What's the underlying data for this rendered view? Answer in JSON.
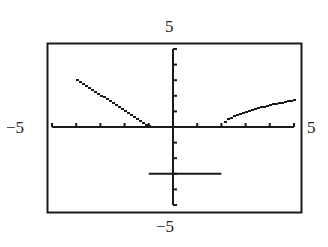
{
  "window": {
    "xmin": -5,
    "xmax": 5,
    "ymin": -5,
    "ymax": 5,
    "xscl": 1,
    "yscl": 1
  },
  "labels": {
    "ymax": "5",
    "ymin": "−5",
    "xmin": "−5",
    "xmax": "5"
  },
  "colors": {
    "ink": "#1a1a1a",
    "background": "#ffffff"
  },
  "chart_data": {
    "type": "line",
    "title": "",
    "xlabel": "",
    "ylabel": "",
    "xlim": [
      -5,
      5
    ],
    "ylim": [
      -5,
      5
    ],
    "grid": false,
    "legend": null,
    "tick_spacing": {
      "x": 1,
      "y": 1
    },
    "window_labels": {
      "top": "5",
      "bottom": "−5",
      "left": "−5",
      "right": "5"
    },
    "series": [
      {
        "name": "piece-1",
        "rule": "y = -x - 1, x ≤ -1",
        "style": "stair-dotted",
        "x": [
          -4,
          -3.5,
          -3,
          -2.5,
          -2,
          -1.5,
          -1
        ],
        "y": [
          3,
          2.5,
          2,
          1.5,
          1,
          0.5,
          0
        ]
      },
      {
        "name": "piece-2",
        "rule": "y = -3, -1 < x < 2",
        "style": "solid",
        "x": [
          -1,
          2
        ],
        "y": [
          -3,
          -3
        ]
      },
      {
        "name": "piece-3",
        "rule": "y = sqrt(x - 2), x ≥ 2",
        "style": "stair-dotted",
        "x": [
          2,
          2.25,
          2.5,
          3,
          3.5,
          4,
          4.5,
          5
        ],
        "y": [
          0,
          0.5,
          0.71,
          1,
          1.22,
          1.41,
          1.58,
          1.73
        ]
      }
    ]
  }
}
